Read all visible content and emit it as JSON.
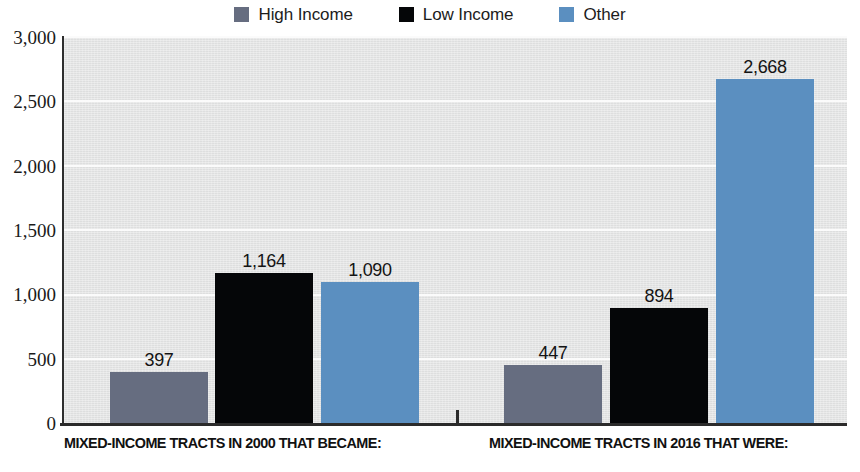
{
  "legend": {
    "items": [
      {
        "label": "High Income",
        "color": "#666d80",
        "icon": "square-swatch"
      },
      {
        "label": "Low Income",
        "color": "#050608",
        "icon": "square-swatch"
      },
      {
        "label": "Other",
        "color": "#5b8fc0",
        "icon": "square-swatch"
      }
    ]
  },
  "axis": {
    "y_ticks": [
      "3,000",
      "2,500",
      "2,000",
      "1,500",
      "1,000",
      "500",
      "0"
    ]
  },
  "groups": [
    {
      "caption": "MIXED-INCOME TRACTS IN 2000 THAT BECAME:"
    },
    {
      "caption": "MIXED-INCOME TRACTS IN 2016 THAT WERE:"
    }
  ],
  "bars": [
    {
      "label": "397",
      "series": "High Income",
      "group": 0,
      "value": 397
    },
    {
      "label": "1,164",
      "series": "Low Income",
      "group": 0,
      "value": 1164
    },
    {
      "label": "1,090",
      "series": "Other",
      "group": 0,
      "value": 1090
    },
    {
      "label": "447",
      "series": "High Income",
      "group": 1,
      "value": 447
    },
    {
      "label": "894",
      "series": "Low Income",
      "group": 1,
      "value": 894
    },
    {
      "label": "2,668",
      "series": "Other",
      "group": 1,
      "value": 2668
    }
  ],
  "chart_data": {
    "type": "bar",
    "title": "",
    "subtitle": "",
    "xlabel": "",
    "ylabel": "",
    "categories": [
      "MIXED-INCOME TRACTS IN 2000 THAT BECAME:",
      "MIXED-INCOME TRACTS IN 2016 THAT WERE:"
    ],
    "series": [
      {
        "name": "High Income",
        "color": "#666d80",
        "values": [
          397,
          447
        ]
      },
      {
        "name": "Low Income",
        "color": "#050608",
        "values": [
          1164,
          894
        ]
      },
      {
        "name": "Other",
        "color": "#5b8fc0",
        "values": [
          1090,
          2668
        ]
      }
    ],
    "data_labels": [
      "397",
      "1,164",
      "1,090",
      "447",
      "894",
      "2,668"
    ],
    "ylim": [
      0,
      3000
    ],
    "ytick_values": [
      0,
      500,
      1000,
      1500,
      2000,
      2500,
      3000
    ],
    "ytick_labels": [
      "0",
      "500",
      "1,000",
      "1,500",
      "2,000",
      "2,500",
      "3,000"
    ],
    "grid": "horizontal",
    "grid_color": "#fbfbfb",
    "plot_background": "#e4e5e5",
    "legend_position": "top-center"
  }
}
